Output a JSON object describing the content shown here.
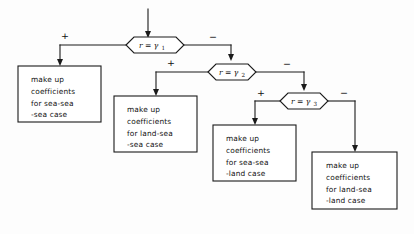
{
  "diagram": {
    "background_color": "#fdfdfd",
    "line_color": "#1a1a1a",
    "text_color": "#101010",
    "entry": {
      "label": "",
      "icon": "down-arrow-icon"
    },
    "decisions": [
      {
        "id": "decision-1",
        "variable": "r",
        "operator": "=",
        "threshold": "γ",
        "subscript": "1",
        "text": "r = γ₁",
        "branch_positive": "+",
        "branch_negative": "−"
      },
      {
        "id": "decision-2",
        "variable": "r",
        "operator": "=",
        "threshold": "γ",
        "subscript": "2",
        "text": "r = γ₂",
        "branch_positive": "+",
        "branch_negative": "−"
      },
      {
        "id": "decision-3",
        "variable": "r",
        "operator": "=",
        "threshold": "γ",
        "subscript": "3",
        "text": "r = γ₃",
        "branch_positive": "+",
        "branch_negative": "−"
      }
    ],
    "processes": [
      {
        "id": "process-sea-sea-sea",
        "line1": "make up",
        "line2": "coefficients",
        "line3": "for sea-sea",
        "line4": "-sea case"
      },
      {
        "id": "process-land-sea-sea",
        "line1": "make up",
        "line2": "coefficients",
        "line3": "for land-sea",
        "line4": "-sea case"
      },
      {
        "id": "process-sea-sea-land",
        "line1": "make up",
        "line2": "coefficients",
        "line3": "for sea-sea",
        "line4": "-land case"
      },
      {
        "id": "process-land-sea-land",
        "line1": "make up",
        "line2": "coefficients",
        "line3": "for land-sea",
        "line4": "-land case"
      }
    ]
  }
}
